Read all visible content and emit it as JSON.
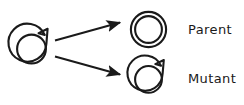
{
  "figure": {
    "type": "biological-schematic",
    "background_color": "#ffffff",
    "stroke_color": "#1a1a1a",
    "caption_color": "#1a1a1a"
  },
  "source": {
    "name": "parent-plasmid-source",
    "shape": "notched-double-ring-circle",
    "center": {
      "x": 31.5,
      "y": 48
    },
    "outer_radius": 19,
    "inner_radius": 15,
    "has_notch": true,
    "notch_position": "upper-right"
  },
  "arrows": [
    {
      "name": "arrow-to-parent",
      "from": {
        "x": 55,
        "y": 40
      },
      "to": {
        "x": 122,
        "y": 22
      },
      "direction": "up-right"
    },
    {
      "name": "arrow-to-mutant",
      "from": {
        "x": 55,
        "y": 56
      },
      "to": {
        "x": 122,
        "y": 74
      },
      "direction": "down-right"
    }
  ],
  "outcomes": [
    {
      "id": "parent",
      "label": "Parent",
      "shape": "plain-double-ring-circle",
      "has_notch": false,
      "center": {
        "x": 148.5,
        "y": 29.5
      },
      "outer_radius": 18,
      "inner_radius": 14,
      "label_position": {
        "x": 188,
        "y": 34
      }
    },
    {
      "id": "mutant",
      "label": "Mutant",
      "shape": "notched-double-ring-circle",
      "has_notch": true,
      "notch_position": "upper-right",
      "center": {
        "x": 148.5,
        "y": 78.5
      },
      "outer_radius": 18,
      "inner_radius": 14,
      "label_position": {
        "x": 188,
        "y": 83
      }
    }
  ]
}
